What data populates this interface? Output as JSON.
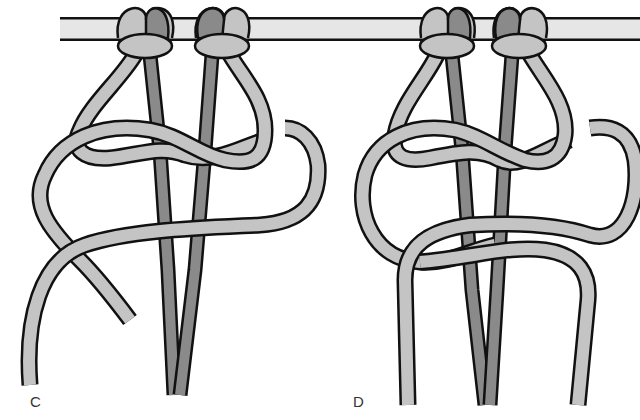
{
  "figure": {
    "panels": [
      {
        "id": "C",
        "label": "C"
      },
      {
        "id": "D",
        "label": "D"
      }
    ]
  },
  "colors": {
    "background": "#ffffff",
    "outline": "#111111",
    "dowel_fill": "#e6e6e6",
    "working_cord_fill": "#c4c4c4",
    "filler_cord_fill": "#8a8a8a",
    "label_text": "#333333"
  }
}
